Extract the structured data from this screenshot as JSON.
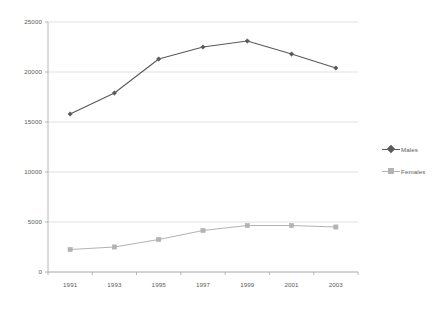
{
  "chart_data": {
    "type": "line",
    "title": "",
    "subtitle": "",
    "xlabel": "",
    "ylabel": "",
    "categories": [
      "1991",
      "1993",
      "1995",
      "1997",
      "1999",
      "2001",
      "2003"
    ],
    "series": [
      {
        "name": "Males",
        "color": "#595959",
        "marker": "diamond",
        "values": [
          15800,
          17900,
          21300,
          22500,
          23100,
          21800,
          20400
        ]
      },
      {
        "name": "Females",
        "color": "#b3b3b3",
        "marker": "square",
        "values": [
          2250,
          2500,
          3250,
          4150,
          4650,
          4650,
          4500
        ]
      }
    ],
    "ylim": [
      0,
      25000
    ],
    "ytick_values": [
      0,
      5000,
      10000,
      15000,
      20000,
      25000
    ],
    "ytick_labels": [
      "0",
      "5000",
      "10000",
      "15000",
      "20000",
      "25000"
    ],
    "grid": {
      "horizontal": true,
      "vertical": false,
      "color": "#d9d9d9"
    },
    "legend": {
      "position": "right",
      "entries": [
        {
          "label": "Males",
          "color": "#595959",
          "marker": "diamond"
        },
        {
          "label": "Females",
          "color": "#b3b3b3",
          "marker": "square"
        }
      ]
    },
    "axis": {
      "line_color": "#a6a6a6",
      "tick_color": "#a6a6a6"
    },
    "background_color": "#ffffff"
  }
}
